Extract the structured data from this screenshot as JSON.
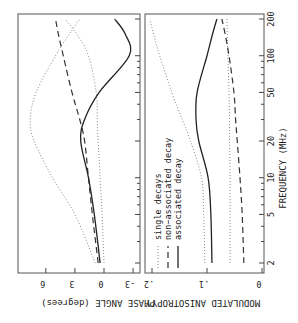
{
  "chart_data": [
    {
      "type": "line",
      "panel": "top",
      "title": "",
      "xlabel": "FREQUENCY (MHz)",
      "ylabel": "PHASE ANGLE (degrees)",
      "x_scale": "log",
      "x_ticks": [
        2,
        5,
        10,
        20,
        50,
        100,
        200
      ],
      "y_ticks": [
        -3,
        0,
        3,
        6
      ],
      "ylim": [
        -3,
        8
      ],
      "xlim": [
        2,
        200
      ],
      "grid": false,
      "orientation": "rotated 90 degrees clockwise",
      "x": [
        2,
        5,
        10,
        20,
        30,
        50,
        100,
        150,
        200
      ],
      "series": [
        {
          "name": "single decays (1)",
          "style": "dotted",
          "values": [
            0.9,
            3.0,
            5.3,
            7.2,
            7.6,
            7.0,
            5.0,
            3.6,
            2.5
          ]
        },
        {
          "name": "single decays (2)",
          "style": "dotted",
          "values": [
            0.0,
            0.2,
            0.4,
            0.6,
            0.7,
            0.8,
            1.6,
            2.8,
            4.0
          ]
        },
        {
          "name": "non-associated decay",
          "style": "dashed",
          "values": [
            0.6,
            1.2,
            1.6,
            2.0,
            2.5,
            3.3,
            4.2,
            4.7,
            5.0
          ]
        },
        {
          "name": "associated decay",
          "style": "solid",
          "values": [
            0.4,
            1.0,
            1.6,
            2.4,
            2.0,
            0.5,
            -2.6,
            -2.2,
            -1.1
          ]
        }
      ]
    },
    {
      "type": "line",
      "panel": "bottom",
      "title": "",
      "xlabel": "FREQUENCY (MHz)",
      "ylabel": "MODULATED ANISOTROPY",
      "x_scale": "log",
      "x_ticks": [
        2,
        5,
        10,
        20,
        50,
        100,
        200
      ],
      "y_ticks": [
        0,
        0.1,
        0.2
      ],
      "ylim": [
        0,
        0.2
      ],
      "xlim": [
        2,
        200
      ],
      "grid": false,
      "orientation": "rotated 90 degrees clockwise",
      "x": [
        2,
        5,
        10,
        20,
        30,
        50,
        100,
        150,
        200
      ],
      "series": [
        {
          "name": "single decays (1)",
          "style": "dotted",
          "values": [
            0.104,
            0.106,
            0.11,
            0.13,
            0.145,
            0.164,
            0.186,
            0.197,
            0.204
          ]
        },
        {
          "name": "single decays (2)",
          "style": "dotted",
          "values": [
            0.058,
            0.058,
            0.058,
            0.059,
            0.059,
            0.06,
            0.062,
            0.063,
            0.064
          ]
        },
        {
          "name": "non-associated decay",
          "style": "dashed",
          "values": [
            0.033,
            0.036,
            0.04,
            0.045,
            0.048,
            0.051,
            0.06,
            0.067,
            0.073
          ]
        },
        {
          "name": "associated decay",
          "style": "solid",
          "values": [
            0.091,
            0.093,
            0.098,
            0.115,
            0.12,
            0.118,
            0.1,
            0.09,
            0.082
          ]
        }
      ]
    }
  ],
  "labels": {
    "freq_axis": "FREQUENCY  (MHz)",
    "phase_axis": "PHASE ANGLE  (degrees)",
    "anis_axis": "MODULATED ANISOTROPY",
    "legend": [
      "single decays",
      "non−associated decay",
      "associated decay"
    ],
    "freq_ticks": [
      "2",
      "5",
      "10",
      "20",
      "50",
      "100",
      "200"
    ],
    "phase_ticks": [
      "6",
      "3",
      "0",
      "-3"
    ],
    "anis_ticks": [
      ".2",
      ".1",
      "0"
    ]
  }
}
